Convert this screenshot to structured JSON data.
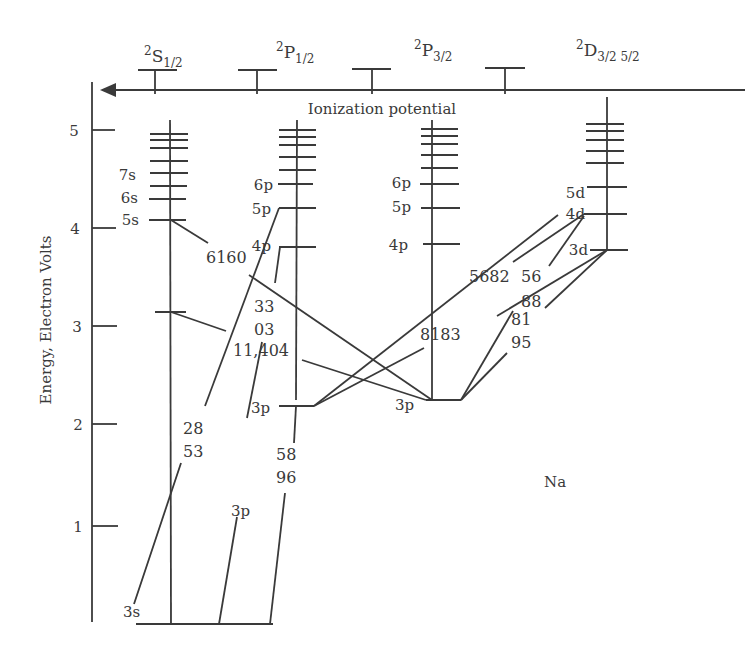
{
  "diagram": {
    "title": "Na",
    "type": "energy-level (Grotrian) diagram",
    "y_axis": {
      "label": "Energy, Electron Volts",
      "ticks": [
        "1",
        "2",
        "3",
        "4",
        "5"
      ]
    },
    "ionization_label": "Ionization potential",
    "columns": [
      {
        "term": "2",
        "letter": "S",
        "sub": "1/2"
      },
      {
        "term": "2",
        "letter": "P",
        "sub": "1/2"
      },
      {
        "term": "2",
        "letter": "P",
        "sub": "3/2"
      },
      {
        "term": "2",
        "letter": "D",
        "sub": "3/2 5/2"
      }
    ],
    "level_labels": {
      "s": [
        "3s",
        "5s",
        "6s",
        "7s"
      ],
      "p12": [
        "3p",
        "4p",
        "5p",
        "6p"
      ],
      "p32": [
        "3p",
        "4p",
        "5p",
        "6p"
      ],
      "d": [
        "3d",
        "4d",
        "5d"
      ],
      "ground_3p_label": "3p"
    },
    "transitions": {
      "t6160": "6160",
      "t3303a": "33",
      "t3303b": "03",
      "t11404": "11,404",
      "t2853a": "28",
      "t2853b": "53",
      "t5896a": "58",
      "t5896b": "96",
      "t5682": "5682",
      "t5688a": "56",
      "t5688b": "88",
      "t8183": "8183",
      "t8195a": "81",
      "t8195b": "95"
    }
  }
}
